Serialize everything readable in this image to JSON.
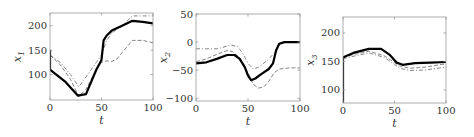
{
  "chart_data": [
    {
      "type": "line",
      "title": "",
      "xlabel": "t",
      "ylabel": "x1",
      "ylabel_main": "x",
      "ylabel_sub": "1",
      "xlim": [
        0,
        100
      ],
      "ylim": [
        48,
        226
      ],
      "xticks": [
        0,
        50,
        100
      ],
      "yticks": [
        100,
        150,
        200
      ],
      "grid": false,
      "series": [
        {
          "name": "solid",
          "style": "solid",
          "x": [
            0,
            0,
            3,
            8,
            15,
            27,
            35,
            45,
            50,
            52,
            55,
            60,
            70,
            80,
            90,
            100
          ],
          "y": [
            150,
            110,
            105,
            97,
            85,
            57,
            60,
            110,
            130,
            170,
            180,
            190,
            200,
            210,
            208,
            205
          ]
        },
        {
          "name": "dashed",
          "style": "dashed",
          "x": [
            0,
            10,
            20,
            28,
            35,
            45,
            50,
            55,
            60,
            65,
            70,
            80,
            90,
            100
          ],
          "y": [
            140,
            120,
            90,
            55,
            70,
            110,
            125,
            128,
            127,
            132,
            145,
            170,
            170,
            165
          ]
        },
        {
          "name": "dash-dot",
          "style": "dashdot",
          "x": [
            0,
            10,
            20,
            28,
            35,
            45,
            50,
            55,
            60,
            70,
            80,
            90,
            100
          ],
          "y": [
            140,
            125,
            100,
            75,
            95,
            125,
            140,
            170,
            185,
            200,
            220,
            220,
            220
          ]
        }
      ]
    },
    {
      "type": "line",
      "title": "",
      "xlabel": "t",
      "ylabel": "x2",
      "ylabel_main": "x",
      "ylabel_sub": "2",
      "xlim": [
        0,
        100
      ],
      "ylim": [
        -105,
        50
      ],
      "xticks": [
        0,
        50,
        100
      ],
      "yticks": [
        -100,
        -50,
        0,
        50
      ],
      "grid": false,
      "series": [
        {
          "name": "solid",
          "style": "solid",
          "x": [
            0,
            10,
            20,
            30,
            37,
            42,
            47,
            50,
            53,
            57,
            62,
            70,
            74,
            77,
            80,
            85,
            100
          ],
          "y": [
            -38,
            -36,
            -30,
            -23,
            -23,
            -30,
            -45,
            -60,
            -68,
            -65,
            -58,
            -48,
            -38,
            -15,
            -3,
            0,
            0
          ]
        },
        {
          "name": "dashed",
          "style": "dashed",
          "x": [
            0,
            10,
            20,
            30,
            35,
            42,
            50,
            55,
            60,
            65,
            70,
            75,
            80,
            90,
            100
          ],
          "y": [
            -35,
            -30,
            -22,
            -15,
            -17,
            -28,
            -55,
            -75,
            -82,
            -80,
            -70,
            -55,
            -48,
            -46,
            -46
          ]
        },
        {
          "name": "dash-dot",
          "style": "dashdot",
          "x": [
            0,
            10,
            20,
            25,
            33,
            40,
            45,
            50,
            55,
            60,
            65,
            70,
            75,
            80,
            85,
            100
          ],
          "y": [
            -12,
            -12,
            -12,
            -10,
            -5,
            -8,
            -20,
            -38,
            -48,
            -45,
            -38,
            -30,
            -20,
            -5,
            0,
            0
          ]
        }
      ]
    },
    {
      "type": "line",
      "title": "",
      "xlabel": "t",
      "ylabel": "x3",
      "ylabel_main": "x",
      "ylabel_sub": "3",
      "xlim": [
        0,
        100
      ],
      "ylim": [
        77,
        228
      ],
      "xticks": [
        0,
        50,
        100
      ],
      "yticks": [
        100,
        150,
        200
      ],
      "grid": false,
      "series": [
        {
          "name": "solid",
          "style": "solid",
          "x": [
            0,
            0,
            5,
            10,
            25,
            37,
            45,
            52,
            58,
            70,
            85,
            100
          ],
          "y": [
            77,
            157,
            161,
            165,
            172,
            172,
            162,
            148,
            144,
            147,
            148,
            149
          ]
        },
        {
          "name": "dashed",
          "style": "dashed",
          "x": [
            0,
            10,
            25,
            40,
            50,
            55,
            65,
            80,
            100
          ],
          "y": [
            157,
            162,
            168,
            160,
            148,
            142,
            138,
            140,
            146
          ]
        },
        {
          "name": "dash-dot",
          "style": "dashdot",
          "x": [
            0,
            10,
            25,
            40,
            50,
            55,
            65,
            80,
            100
          ],
          "y": [
            155,
            159,
            165,
            157,
            145,
            138,
            134,
            135,
            140
          ]
        }
      ]
    }
  ],
  "panels": [
    {
      "box": {
        "left": 50,
        "top": 13,
        "right": 153,
        "bottom": 100
      }
    },
    {
      "box": {
        "left": 196,
        "top": 14,
        "right": 300,
        "bottom": 101
      }
    },
    {
      "box": {
        "left": 343,
        "top": 17,
        "right": 446,
        "bottom": 103
      }
    }
  ]
}
